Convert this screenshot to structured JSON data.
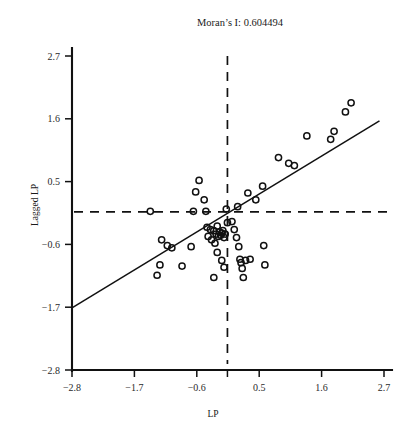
{
  "chart_data": {
    "type": "scatter",
    "title": "Moran’s I: 0.604494",
    "moran_i": 0.604494,
    "xlabel": "LP",
    "ylabel": "Lagged LP",
    "xlim": [
      -2.8,
      2.7
    ],
    "ylim": [
      -2.8,
      2.7
    ],
    "xticks": [
      -2.8,
      -1.7,
      -0.6,
      0.5,
      1.6,
      2.7
    ],
    "xtick_labels": [
      "−2.8",
      "−1.7",
      "−0.6",
      "0.5",
      "1.6",
      "2.7"
    ],
    "yticks": [
      -2.8,
      -1.7,
      -0.6,
      0.5,
      1.6,
      2.7
    ],
    "ytick_labels": [
      "−2.8",
      "−1.7",
      "−0.6",
      "0.5",
      "1.6",
      "2.7"
    ],
    "grid": false,
    "legend": "none",
    "reference_lines": {
      "vertical_mean_x": -0.06,
      "horizontal_mean_y": -0.03,
      "style": "dashed"
    },
    "fit_line": {
      "slope": 0.604494,
      "intercept": -0.02,
      "x_start": -2.8,
      "x_end": 2.62,
      "style": "solid"
    },
    "marker": {
      "shape": "open-circle",
      "radius_px": 3.1,
      "color": "#111111"
    },
    "points": [
      [
        -1.42,
        -0.02
      ],
      [
        -1.22,
        -0.52
      ],
      [
        -1.12,
        -0.62
      ],
      [
        -1.04,
        -0.66
      ],
      [
        -1.25,
        -0.96
      ],
      [
        -1.3,
        -1.14
      ],
      [
        -0.86,
        -0.98
      ],
      [
        -0.7,
        -0.64
      ],
      [
        -0.66,
        -0.02
      ],
      [
        -0.62,
        0.32
      ],
      [
        -0.56,
        0.52
      ],
      [
        -0.47,
        0.18
      ],
      [
        -0.44,
        -0.02
      ],
      [
        -0.42,
        -0.3
      ],
      [
        -0.4,
        -0.46
      ],
      [
        -0.36,
        -0.34
      ],
      [
        -0.34,
        -0.52
      ],
      [
        -0.3,
        -0.36
      ],
      [
        -0.28,
        -0.58
      ],
      [
        -0.26,
        -0.42
      ],
      [
        -0.24,
        -0.28
      ],
      [
        -0.22,
        -0.46
      ],
      [
        -0.2,
        -0.38
      ],
      [
        -0.18,
        -0.44
      ],
      [
        -0.16,
        -0.4
      ],
      [
        -0.14,
        -0.36
      ],
      [
        -0.12,
        -0.48
      ],
      [
        -0.1,
        -0.42
      ],
      [
        -0.24,
        -0.74
      ],
      [
        -0.16,
        -0.88
      ],
      [
        -0.12,
        -1.0
      ],
      [
        -0.3,
        -1.18
      ],
      [
        -0.08,
        0.02
      ],
      [
        -0.06,
        -0.22
      ],
      [
        0.02,
        -0.2
      ],
      [
        0.06,
        -0.34
      ],
      [
        0.1,
        -0.48
      ],
      [
        0.12,
        0.06
      ],
      [
        0.14,
        -0.64
      ],
      [
        0.16,
        -0.86
      ],
      [
        0.18,
        -0.92
      ],
      [
        0.26,
        -0.88
      ],
      [
        0.34,
        -0.86
      ],
      [
        0.2,
        -1.02
      ],
      [
        0.22,
        -1.18
      ],
      [
        0.6,
        -0.96
      ],
      [
        0.58,
        -0.62
      ],
      [
        0.3,
        0.3
      ],
      [
        0.44,
        0.18
      ],
      [
        0.56,
        0.42
      ],
      [
        0.84,
        0.92
      ],
      [
        1.02,
        0.82
      ],
      [
        1.12,
        0.78
      ],
      [
        1.34,
        1.3
      ],
      [
        1.76,
        1.24
      ],
      [
        1.82,
        1.38
      ],
      [
        2.02,
        1.72
      ],
      [
        2.12,
        1.88
      ]
    ]
  }
}
